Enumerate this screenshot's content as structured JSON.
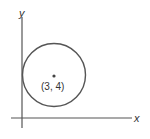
{
  "diagram": {
    "x_axis_label": "x",
    "y_axis_label": "y",
    "center_label": "(3, 4)",
    "colors": {
      "stroke": "#555555",
      "text": "#333333",
      "background": "#ffffff"
    }
  }
}
